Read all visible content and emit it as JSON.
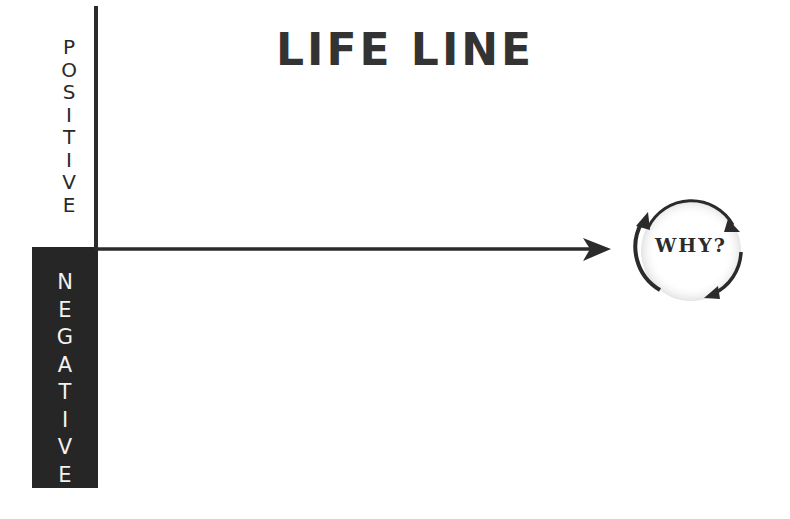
{
  "title": "LIFE LINE",
  "axis": {
    "positive_label": [
      "P",
      "O",
      "S",
      "I",
      "T",
      "I",
      "V",
      "E"
    ],
    "negative_label": [
      "N",
      "E",
      "G",
      "A",
      "T",
      "I",
      "V",
      "E"
    ],
    "positive_word": "POSITIVE",
    "negative_word": "NEGATIVE"
  },
  "cycle": {
    "label": "WHY?",
    "icon": "cycle-arrows-icon"
  },
  "colors": {
    "line": "#2b2b2b",
    "negative_box": "#262626",
    "negative_text": "#f2f2f2",
    "title": "#333333"
  }
}
